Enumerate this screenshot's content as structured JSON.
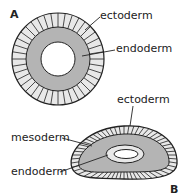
{
  "panels": {
    "a": {
      "letter": "A",
      "labels": {
        "ectoderm": "ectoderm",
        "endoderm": "endoderm"
      }
    },
    "b": {
      "letter": "B",
      "labels": {
        "ectoderm": "ectoderm",
        "mesoderm": "mesoderm",
        "endoderm": "endoderm"
      }
    }
  },
  "colors": {
    "ectoderm_fill": "#e8e8e8",
    "endoderm_fill": "#b4b4b4",
    "mesoderm_fill": "#b4b4b4",
    "inner_endoderm_fill": "#e8e8e8",
    "outline": "#222222"
  }
}
